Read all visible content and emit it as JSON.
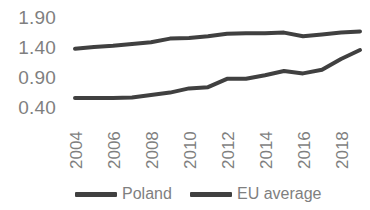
{
  "chart_data": {
    "type": "line",
    "title": "",
    "xlabel": "",
    "ylabel": "",
    "x": [
      2004,
      2005,
      2006,
      2007,
      2008,
      2009,
      2010,
      2011,
      2012,
      2013,
      2014,
      2015,
      2016,
      2017,
      2018,
      2019
    ],
    "xlim": [
      2004,
      2019
    ],
    "ylim": [
      0.4,
      1.9
    ],
    "yticks": [
      "0.40",
      "0.90",
      "1.40",
      "1.90"
    ],
    "xticks": [
      "2004",
      "2006",
      "2008",
      "2010",
      "2012",
      "2014",
      "2016",
      "2018"
    ],
    "grid": false,
    "legend_position": "bottom",
    "series": [
      {
        "name": "Poland",
        "color": "#404040",
        "values": [
          0.55,
          0.55,
          0.55,
          0.56,
          0.6,
          0.64,
          0.71,
          0.73,
          0.87,
          0.87,
          0.93,
          1.0,
          0.96,
          1.02,
          1.2,
          1.35
        ]
      },
      {
        "name": "EU average",
        "color": "#404040",
        "values": [
          1.37,
          1.4,
          1.42,
          1.45,
          1.48,
          1.54,
          1.55,
          1.58,
          1.62,
          1.63,
          1.63,
          1.64,
          1.58,
          1.61,
          1.64,
          1.66
        ]
      }
    ]
  },
  "y_axis": {
    "ticks": [
      {
        "label": "1.90",
        "value": 1.9
      },
      {
        "label": "1.40",
        "value": 1.4
      },
      {
        "label": "0.90",
        "value": 0.9
      },
      {
        "label": "0.40",
        "value": 0.4
      }
    ]
  },
  "x_axis": {
    "ticks": [
      {
        "label": "2004",
        "value": 2004
      },
      {
        "label": "2006",
        "value": 2006
      },
      {
        "label": "2008",
        "value": 2008
      },
      {
        "label": "2010",
        "value": 2010
      },
      {
        "label": "2012",
        "value": 2012
      },
      {
        "label": "2014",
        "value": 2014
      },
      {
        "label": "2016",
        "value": 2016
      },
      {
        "label": "2018",
        "value": 2018
      }
    ]
  },
  "legend": {
    "items": [
      {
        "label": "Poland",
        "color": "#404040"
      },
      {
        "label": "EU average",
        "color": "#404040"
      }
    ]
  },
  "colors": {
    "line": "#404040",
    "text": "#7f7f7f",
    "background": "#ffffff"
  }
}
